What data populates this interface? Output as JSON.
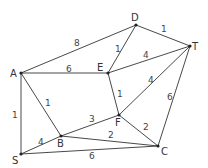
{
  "nodes": [
    {
      "id": "A",
      "x": 21,
      "y": 73,
      "lx": 10,
      "ly": 77
    },
    {
      "id": "D",
      "x": 136,
      "y": 25,
      "lx": 131,
      "ly": 21
    },
    {
      "id": "T",
      "x": 190,
      "y": 46,
      "lx": 192,
      "ly": 50
    },
    {
      "id": "E",
      "x": 108,
      "y": 73,
      "lx": 97,
      "ly": 71
    },
    {
      "id": "F",
      "x": 119,
      "y": 115,
      "lx": 115,
      "ly": 126
    },
    {
      "id": "B",
      "x": 61,
      "y": 136,
      "lx": 57,
      "ly": 147
    },
    {
      "id": "S",
      "x": 21,
      "y": 154,
      "lx": 12,
      "ly": 164
    },
    {
      "id": "C",
      "x": 158,
      "y": 146,
      "lx": 161,
      "ly": 155
    }
  ],
  "edges": [
    {
      "from": "A",
      "to": "D",
      "w": "8",
      "wx": 74,
      "wy": 46
    },
    {
      "from": "A",
      "to": "E",
      "w": "6",
      "wx": 66,
      "wy": 72
    },
    {
      "from": "A",
      "to": "S",
      "w": "1",
      "wx": 12,
      "wy": 118
    },
    {
      "from": "A",
      "to": "B",
      "w": "1",
      "wx": 45,
      "wy": 106
    },
    {
      "from": "D",
      "to": "T",
      "w": "1",
      "wx": 161,
      "wy": 32
    },
    {
      "from": "D",
      "to": "E",
      "w": "1",
      "wx": 115,
      "wy": 52
    },
    {
      "from": "E",
      "to": "T",
      "w": "4",
      "wx": 143,
      "wy": 58
    },
    {
      "from": "E",
      "to": "F",
      "w": "1",
      "wx": 117,
      "wy": 97
    },
    {
      "from": "F",
      "to": "T",
      "w": "4",
      "wx": 148,
      "wy": 83
    },
    {
      "from": "T",
      "to": "C",
      "w": "6",
      "wx": 167,
      "wy": 100
    },
    {
      "from": "B",
      "to": "F",
      "w": "3",
      "wx": 89,
      "wy": 122
    },
    {
      "from": "F",
      "to": "C",
      "w": "2",
      "wx": 143,
      "wy": 130
    },
    {
      "from": "B",
      "to": "C",
      "w": "2",
      "wx": 108,
      "wy": 138
    },
    {
      "from": "S",
      "to": "B",
      "w": "4",
      "wx": 38,
      "wy": 145
    },
    {
      "from": "S",
      "to": "C",
      "w": "6",
      "wx": 89,
      "wy": 159
    }
  ]
}
